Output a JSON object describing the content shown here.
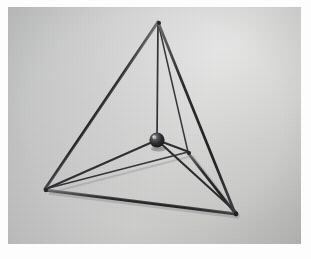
{
  "image": {
    "subject": "tetrahedron wire-frame model with central sphere",
    "medium": "photograph",
    "frame_color": "#fdfdfd",
    "background_color": "#c7c8c7",
    "rod_color": "#2a2a2c",
    "sphere_color": "#1d1d20",
    "photo_rect": {
      "x": 8,
      "y": 7,
      "width": 293,
      "height": 237
    },
    "caption": ""
  },
  "model_geometry": {
    "units": "pixels relative to photo origin",
    "vertices": [
      {
        "name": "apex",
        "label": "A",
        "x": 150,
        "y": 15
      },
      {
        "name": "left-front",
        "label": "B",
        "x": 37,
        "y": 182
      },
      {
        "name": "right-front",
        "label": "C",
        "x": 227,
        "y": 206
      },
      {
        "name": "back",
        "label": "D",
        "x": 180,
        "y": 145
      }
    ],
    "center_sphere": {
      "name": "center-sphere",
      "x": 149,
      "y": 133,
      "radius": 7.5
    },
    "outer_edges": [
      {
        "from": "apex",
        "to": "left-front",
        "style": "thick-front"
      },
      {
        "from": "apex",
        "to": "right-front",
        "style": "thick-front"
      },
      {
        "from": "apex",
        "to": "back",
        "style": "thin-back"
      },
      {
        "from": "left-front",
        "to": "right-front",
        "style": "thick-front"
      },
      {
        "from": "left-front",
        "to": "back",
        "style": "thin-back"
      },
      {
        "from": "back",
        "to": "right-front",
        "style": "thick-front"
      }
    ],
    "center_spokes": [
      {
        "from": "center-sphere",
        "to": "apex"
      },
      {
        "from": "center-sphere",
        "to": "left-front"
      },
      {
        "from": "center-sphere",
        "to": "right-front"
      },
      {
        "from": "center-sphere",
        "to": "back"
      }
    ],
    "edge_count": 6,
    "spoke_count": 4,
    "vertex_count": 4
  }
}
